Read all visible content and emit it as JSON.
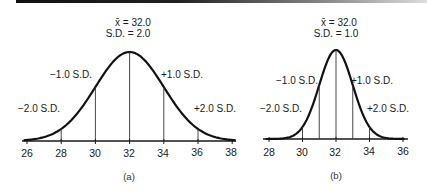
{
  "chart_data": [
    {
      "type": "line",
      "panel": "(a)",
      "title": "",
      "annotations": [
        "x̄ = 32.0",
        "S.D. = 2.0",
        "−1.0 S.D.",
        "+1.0 S.D.",
        "−2.0 S.D.",
        "+2.0 S.D."
      ],
      "mean": 32.0,
      "sd": 2.0,
      "x_ticks": [
        26,
        28,
        30,
        32,
        34,
        36,
        38
      ],
      "xlim": [
        26,
        38
      ],
      "vertical_lines_at": [
        28,
        30,
        32,
        34,
        36
      ],
      "xlabel": "",
      "ylabel": "",
      "grid": false,
      "legend": "none"
    },
    {
      "type": "line",
      "panel": "(b)",
      "title": "",
      "annotations": [
        "x̄ = 32.0",
        "S.D. = 1.0",
        "−1.0 S.D.",
        "+1.0 S.D.",
        "−2.0 S.D.",
        "+2.0 S.D."
      ],
      "mean": 32.0,
      "sd": 1.0,
      "x_ticks": [
        28,
        30,
        32,
        34,
        36
      ],
      "xlim": [
        28,
        36
      ],
      "vertical_lines_at": [
        29,
        30,
        31,
        32,
        33,
        34,
        35
      ],
      "xlabel": "",
      "ylabel": "",
      "grid": false,
      "legend": "none"
    }
  ],
  "panel_a": {
    "mean_label": "x̄ = 32.0",
    "sd_label": "S.D. = 2.0",
    "minus1": "−1.0 S.D.",
    "plus1": "+1.0 S.D.",
    "minus2": "−2.0 S.D.",
    "plus2": "+2.0 S.D.",
    "ticks": [
      "26",
      "28",
      "30",
      "32",
      "34",
      "36",
      "38"
    ],
    "caption": "(a)"
  },
  "panel_b": {
    "mean_label": "x̄ = 32.0",
    "sd_label": "S.D. = 1.0",
    "minus1": "−1.0 S.D.",
    "plus1": "+1.0 S.D.",
    "minus2": "−2.0 S.D.",
    "plus2": "+2.0 S.D.",
    "ticks": [
      "28",
      "30",
      "32",
      "34",
      "36"
    ],
    "caption": "(b)"
  }
}
